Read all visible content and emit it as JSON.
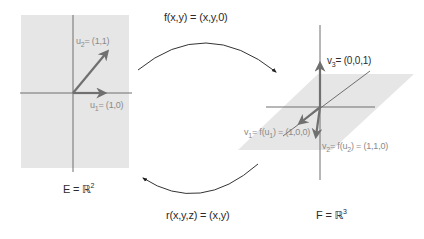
{
  "colors": {
    "plane_fill": "#e6e6e6",
    "axis": "#6e6e6e",
    "vector": "#707070",
    "curve": "#333333",
    "text_dark": "#2b2b2b",
    "text_grey": "#8a8a8a"
  },
  "mappings": {
    "forward": {
      "name": "f",
      "label": "f(x,y) = (x,y,0)"
    },
    "reverse": {
      "name": "r",
      "label": "r(x,y,z) = (x,y)"
    }
  },
  "space_E": {
    "label_prefix": "E = ",
    "field": "ℝ",
    "dimension": "2",
    "vectors": [
      {
        "name": "u",
        "index": "1",
        "value": "= (1,0)"
      },
      {
        "name": "u",
        "index": "2",
        "value": "= (1,1)"
      }
    ]
  },
  "space_F": {
    "label_prefix": "F = ",
    "field": "ℝ",
    "dimension": "3",
    "vectors": [
      {
        "name": "v",
        "index": "1",
        "expr_prefix": "= f(u",
        "expr_index": "1",
        "value": ") = (1,0,0)"
      },
      {
        "name": "v",
        "index": "2",
        "expr_prefix": "= f(u",
        "expr_index": "2",
        "value": ") = (1,1,0)"
      },
      {
        "name": "v",
        "index": "3",
        "value": "= (0,0,1)"
      }
    ]
  }
}
